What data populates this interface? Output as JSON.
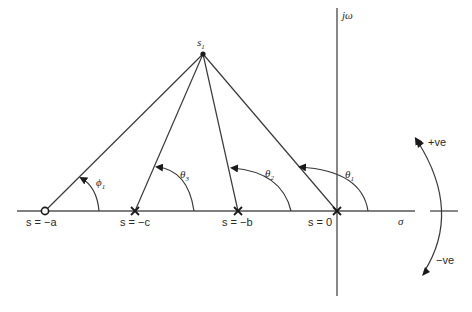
{
  "diagram": {
    "type": "s-plane pole-zero angle diagram",
    "axes": {
      "real_label": "σ",
      "imag_label": "jω"
    },
    "test_point": {
      "label": "s",
      "subscript": "1"
    },
    "zeros": [
      {
        "label": "s = −a",
        "angle_label": "ϕ",
        "angle_subscript": "1"
      }
    ],
    "poles": [
      {
        "label": "s = −c",
        "angle_label": "θ",
        "angle_subscript": "3"
      },
      {
        "label": "s = −b",
        "angle_label": "θ",
        "angle_subscript": "2"
      },
      {
        "label": "s = 0",
        "angle_label": "θ",
        "angle_subscript": "1"
      }
    ],
    "direction_legend": {
      "positive": "+ve",
      "negative": "−ve"
    },
    "colors": {
      "line": "#3a3a3a",
      "background": "#ffffff"
    }
  }
}
